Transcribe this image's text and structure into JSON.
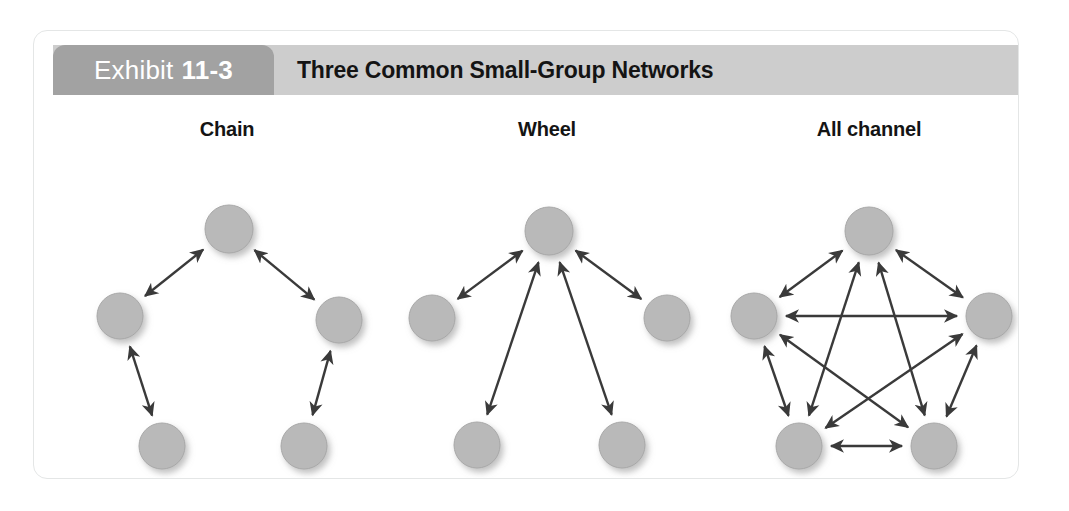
{
  "exhibit": {
    "tab_prefix": "Exhibit",
    "tab_number": "11-3",
    "title": "Three Common Small-Group Networks"
  },
  "colors": {
    "tab_bg": "#a2a2a2",
    "header_bg": "#cdcdcd",
    "card_bg": "#ffffff",
    "card_border": "#e4e6e6",
    "node_fill": "#b9b9b9",
    "node_stroke": "#a8a8a8",
    "arrow": "#3a3a3a",
    "text": "#141414",
    "tab_text": "#ffffff"
  },
  "networks": [
    {
      "id": "chain",
      "label": "Chain",
      "nodes": [
        {
          "id": "top",
          "cx": 195,
          "cy": 134,
          "r": 24
        },
        {
          "id": "left",
          "cx": 86,
          "cy": 221,
          "r": 23
        },
        {
          "id": "right",
          "cx": 305,
          "cy": 225,
          "r": 23
        },
        {
          "id": "bottom-left",
          "cx": 128,
          "cy": 351,
          "r": 23
        },
        {
          "id": "bottom-right",
          "cx": 270,
          "cy": 351,
          "r": 23
        }
      ],
      "edges": [
        {
          "from": "left",
          "to": "top"
        },
        {
          "from": "top",
          "to": "right"
        },
        {
          "from": "bottom-left",
          "to": "left"
        },
        {
          "from": "right",
          "to": "bottom-right"
        }
      ],
      "edge_count": 4,
      "node_count": 5,
      "arrowheads": "double"
    },
    {
      "id": "wheel",
      "label": "Wheel",
      "nodes": [
        {
          "id": "hub",
          "cx": 515,
          "cy": 136,
          "r": 24
        },
        {
          "id": "left",
          "cx": 398,
          "cy": 223,
          "r": 23
        },
        {
          "id": "right",
          "cx": 633,
          "cy": 223,
          "r": 23
        },
        {
          "id": "bottom-left",
          "cx": 443,
          "cy": 350,
          "r": 23
        },
        {
          "id": "bottom-right",
          "cx": 588,
          "cy": 350,
          "r": 23
        }
      ],
      "edges": [
        {
          "from": "hub",
          "to": "left"
        },
        {
          "from": "hub",
          "to": "right"
        },
        {
          "from": "hub",
          "to": "bottom-left"
        },
        {
          "from": "hub",
          "to": "bottom-right"
        }
      ],
      "edge_count": 4,
      "node_count": 5,
      "arrowheads": "double"
    },
    {
      "id": "allchannel",
      "label": "All channel",
      "nodes": [
        {
          "id": "top",
          "cx": 835,
          "cy": 136,
          "r": 24
        },
        {
          "id": "left",
          "cx": 720,
          "cy": 221,
          "r": 23
        },
        {
          "id": "right",
          "cx": 955,
          "cy": 221,
          "r": 23
        },
        {
          "id": "bottom-left",
          "cx": 765,
          "cy": 351,
          "r": 23
        },
        {
          "id": "bottom-right",
          "cx": 900,
          "cy": 351,
          "r": 23
        }
      ],
      "edges": [
        {
          "from": "top",
          "to": "left"
        },
        {
          "from": "top",
          "to": "right"
        },
        {
          "from": "left",
          "to": "right"
        },
        {
          "from": "left",
          "to": "bottom-left"
        },
        {
          "from": "right",
          "to": "bottom-right"
        },
        {
          "from": "bottom-left",
          "to": "bottom-right"
        },
        {
          "from": "top",
          "to": "bottom-left"
        },
        {
          "from": "top",
          "to": "bottom-right"
        },
        {
          "from": "left",
          "to": "bottom-right"
        },
        {
          "from": "right",
          "to": "bottom-left"
        }
      ],
      "edge_count": 10,
      "node_count": 5,
      "arrowheads": "double"
    }
  ]
}
